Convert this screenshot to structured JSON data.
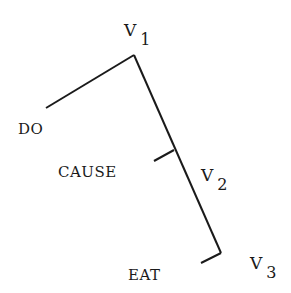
{
  "diagram": {
    "type": "tree",
    "line_color": "#1a1a1a",
    "nodes": {
      "v1": {
        "letter": "V",
        "subscript": "1"
      },
      "v2": {
        "letter": "V",
        "subscript": "2"
      },
      "v3": {
        "letter": "V",
        "subscript": "3"
      }
    },
    "leaves": {
      "do": "DO",
      "cause": "CAUSE",
      "eat": "EAT"
    },
    "edges": [
      {
        "from": "V1",
        "to": "DO"
      },
      {
        "from": "V1",
        "to": "V2"
      },
      {
        "from": "V2",
        "to": "CAUSE"
      },
      {
        "from": "V2",
        "to": "V3"
      },
      {
        "from": "V3",
        "to": "EAT"
      }
    ]
  }
}
